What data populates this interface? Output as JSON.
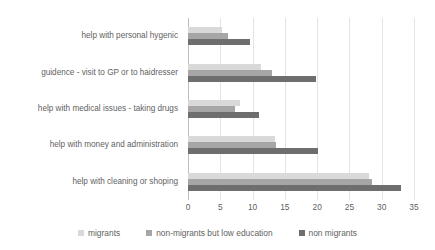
{
  "chart_data": {
    "type": "bar",
    "orientation": "horizontal",
    "title": "",
    "subtitle": "",
    "xlabel": "",
    "ylabel": "",
    "xlim": [
      0,
      35
    ],
    "xticks": [
      0,
      5,
      10,
      15,
      20,
      25,
      30,
      35
    ],
    "xtick_labels": [
      "0",
      "5",
      "10",
      "15",
      "20",
      "25",
      "30",
      "35"
    ],
    "grid": true,
    "legend_position": "bottom",
    "categories": [
      "help with personal hygenic",
      "guidence - visit to GP or to haidresser",
      "help with medical issues - taking drugs",
      "help with money and administration",
      "help with cleaning or shoping"
    ],
    "series": [
      {
        "name": "migrants",
        "color": "#d9d9d9",
        "values": [
          5.3,
          11.3,
          8.0,
          13.5,
          28.0
        ]
      },
      {
        "name": "non-migrants but low education",
        "color": "#a6a6a6",
        "values": [
          6.2,
          13.0,
          7.3,
          13.7,
          28.5
        ]
      },
      {
        "name": "non migrants",
        "color": "#6e6e6e",
        "values": [
          9.6,
          19.8,
          11.0,
          20.2,
          33.0
        ]
      }
    ]
  },
  "colors": {
    "series_light": "#d9d9d9",
    "series_medium": "#a6a6a6",
    "series_dark": "#6e6e6e",
    "gridline": "#e4e4e4",
    "axis": "#bdbdbd",
    "text": "#5f5f5f",
    "background": "#ffffff"
  }
}
